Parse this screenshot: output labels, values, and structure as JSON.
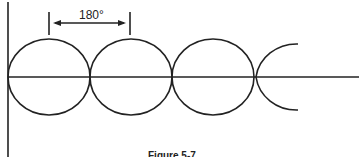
{
  "diagram": {
    "dimension_label": "180°",
    "caption": "Figure 5-7",
    "line_color": "#222222",
    "background": "#ffffff",
    "elements": [
      {
        "type": "vertical-axis"
      },
      {
        "type": "horizontal-axis"
      },
      {
        "type": "loop",
        "index": 1
      },
      {
        "type": "loop",
        "index": 2
      },
      {
        "type": "loop",
        "index": 3
      },
      {
        "type": "partial-loop",
        "index": 4
      },
      {
        "type": "dimension-arrow",
        "span": "180°"
      }
    ]
  }
}
